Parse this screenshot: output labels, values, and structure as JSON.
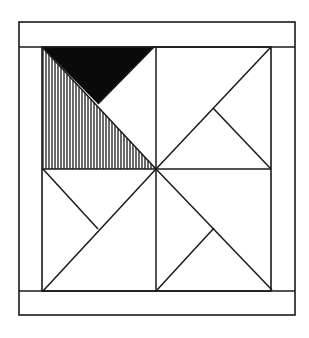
{
  "diagram": {
    "type": "quilt-block",
    "colors": {
      "background": "#ffffff",
      "stroke": "#1a1a1a",
      "solid_fill": "#0a0a0a",
      "hatch": "#1a1a1a"
    },
    "outer_frame": {
      "x1": 19,
      "y1": 22,
      "x2": 295,
      "y2": 315
    },
    "inner_square": {
      "x1": 42,
      "y1": 47,
      "x2": 271,
      "y2": 291
    },
    "center": {
      "x": 156,
      "y": 169
    },
    "shaded_regions": [
      {
        "name": "black-triangle",
        "fill": "solid",
        "points": [
          [
            42,
            47
          ],
          [
            154,
            47
          ],
          [
            98,
            104
          ]
        ]
      },
      {
        "name": "hatched-triangle",
        "fill": "vertical-hatch",
        "points": [
          [
            42,
            47
          ],
          [
            42,
            169
          ],
          [
            156,
            169
          ]
        ]
      }
    ],
    "lines": [
      {
        "name": "tl-diagonal",
        "from": [
          42,
          47
        ],
        "to": [
          156,
          169
        ]
      },
      {
        "name": "tl-branch",
        "from": [
          154,
          47
        ],
        "to": [
          98,
          104
        ]
      },
      {
        "name": "tr-diagonal",
        "from": [
          156,
          169
        ],
        "to": [
          271,
          47
        ]
      },
      {
        "name": "tr-branch",
        "from": [
          213,
          108
        ],
        "to": [
          271,
          169
        ]
      },
      {
        "name": "bl-diagonal",
        "from": [
          156,
          169
        ],
        "to": [
          43,
          291
        ]
      },
      {
        "name": "bl-branch",
        "from": [
          43,
          169
        ],
        "to": [
          98,
          229
        ]
      },
      {
        "name": "br-diagonal",
        "from": [
          156,
          169
        ],
        "to": [
          272,
          290
        ]
      },
      {
        "name": "br-branch",
        "from": [
          157,
          290
        ],
        "to": [
          214,
          228
        ]
      }
    ]
  }
}
